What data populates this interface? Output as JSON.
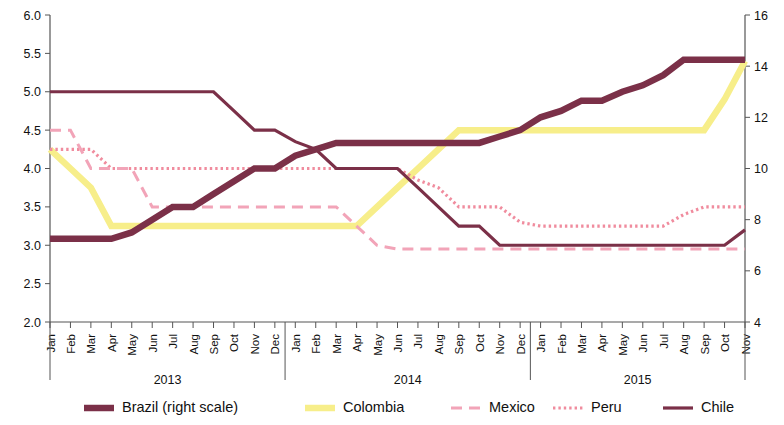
{
  "chart_data": {
    "type": "line",
    "title": "",
    "subtitle": "",
    "xlabel": "",
    "ylabel": "",
    "y2label": "",
    "grid": false,
    "legend_position": "bottom",
    "ylim": [
      2.0,
      6.0
    ],
    "y_ticks": [
      "2.0",
      "2.5",
      "3.0",
      "3.5",
      "4.0",
      "4.5",
      "5.0",
      "5.5",
      "6.0"
    ],
    "y2lim": [
      4,
      16
    ],
    "y2_ticks": [
      "4",
      "6",
      "8",
      "10",
      "12",
      "14",
      "16"
    ],
    "x_group_labels": [
      "2013",
      "2014",
      "2015"
    ],
    "x_groups": [
      {
        "year": "2013",
        "months": [
          "Jan",
          "Feb",
          "Mar",
          "Apr",
          "May",
          "Jun",
          "Jul",
          "Aug",
          "Sep",
          "Oct",
          "Nov",
          "Dec"
        ]
      },
      {
        "year": "2014",
        "months": [
          "Jan",
          "Feb",
          "Mar",
          "Apr",
          "May",
          "Jun",
          "Jul",
          "Aug",
          "Sep",
          "Oct",
          "Nov",
          "Dec"
        ]
      },
      {
        "year": "2015",
        "months": [
          "Jan",
          "Feb",
          "Mar",
          "Apr",
          "May",
          "Jun",
          "Jul",
          "Aug",
          "Sep",
          "Oct",
          "Nov"
        ]
      }
    ],
    "x": [
      "2013-Jan",
      "2013-Feb",
      "2013-Mar",
      "2013-Apr",
      "2013-May",
      "2013-Jun",
      "2013-Jul",
      "2013-Aug",
      "2013-Sep",
      "2013-Oct",
      "2013-Nov",
      "2013-Dec",
      "2014-Jan",
      "2014-Feb",
      "2014-Mar",
      "2014-Apr",
      "2014-May",
      "2014-Jun",
      "2014-Jul",
      "2014-Aug",
      "2014-Sep",
      "2014-Oct",
      "2014-Nov",
      "2014-Dec",
      "2015-Jan",
      "2015-Feb",
      "2015-Mar",
      "2015-Apr",
      "2015-May",
      "2015-Jun",
      "2015-Jul",
      "2015-Aug",
      "2015-Sep",
      "2015-Oct",
      "2015-Nov"
    ],
    "series": [
      {
        "name": "Brazil (right scale)",
        "axis": "right",
        "color": "#7B3048",
        "style": "thick-solid",
        "values": [
          7.25,
          7.25,
          7.25,
          7.25,
          7.5,
          8.0,
          8.5,
          8.5,
          9.0,
          9.5,
          10.0,
          10.0,
          10.5,
          10.75,
          11.0,
          11.0,
          11.0,
          11.0,
          11.0,
          11.0,
          11.0,
          11.0,
          11.25,
          11.5,
          12.0,
          12.25,
          12.65,
          12.65,
          13.0,
          13.25,
          13.65,
          14.25,
          14.25,
          14.25,
          14.25
        ]
      },
      {
        "name": "Colombia",
        "axis": "left",
        "color": "#F7EE8A",
        "style": "thick-solid",
        "values": [
          4.25,
          4.0,
          3.75,
          3.25,
          3.25,
          3.25,
          3.25,
          3.25,
          3.25,
          3.25,
          3.25,
          3.25,
          3.25,
          3.25,
          3.25,
          3.25,
          3.5,
          3.75,
          4.0,
          4.25,
          4.5,
          4.5,
          4.5,
          4.5,
          4.5,
          4.5,
          4.5,
          4.5,
          4.5,
          4.5,
          4.5,
          4.5,
          4.5,
          4.9,
          5.4
        ]
      },
      {
        "name": "Mexico",
        "axis": "left",
        "color": "#F2A4B8",
        "style": "dashed",
        "values": [
          4.5,
          4.5,
          4.0,
          4.0,
          4.0,
          3.5,
          3.5,
          3.5,
          3.5,
          3.5,
          3.5,
          3.5,
          3.5,
          3.5,
          3.5,
          3.25,
          3.0,
          2.95,
          2.95,
          2.95,
          2.95,
          2.95,
          2.95,
          2.95,
          2.95,
          2.95,
          2.95,
          2.95,
          2.95,
          2.95,
          2.95,
          2.95,
          2.95,
          2.95,
          2.95
        ]
      },
      {
        "name": "Peru",
        "axis": "left",
        "color": "#F08C9E",
        "style": "dotted",
        "values": [
          4.25,
          4.25,
          4.25,
          4.0,
          4.0,
          4.0,
          4.0,
          4.0,
          4.0,
          4.0,
          4.0,
          4.0,
          4.0,
          4.0,
          4.0,
          4.0,
          4.0,
          4.0,
          3.85,
          3.75,
          3.5,
          3.5,
          3.5,
          3.3,
          3.25,
          3.25,
          3.25,
          3.25,
          3.25,
          3.25,
          3.25,
          3.4,
          3.5,
          3.5,
          3.5
        ]
      },
      {
        "name": "Chile",
        "axis": "left",
        "color": "#7B3048",
        "style": "thin-solid",
        "values": [
          5.0,
          5.0,
          5.0,
          5.0,
          5.0,
          5.0,
          5.0,
          5.0,
          5.0,
          4.75,
          4.5,
          4.5,
          4.35,
          4.25,
          4.0,
          4.0,
          4.0,
          4.0,
          3.75,
          3.5,
          3.25,
          3.25,
          3.0,
          3.0,
          3.0,
          3.0,
          3.0,
          3.0,
          3.0,
          3.0,
          3.0,
          3.0,
          3.0,
          3.0,
          3.2
        ]
      }
    ],
    "legend": [
      {
        "label": "Brazil (right scale)",
        "color": "#7B3048",
        "style": "thick-solid"
      },
      {
        "label": "Colombia",
        "color": "#F7EE8A",
        "style": "thick-solid"
      },
      {
        "label": "Mexico",
        "color": "#F2A4B8",
        "style": "dashed"
      },
      {
        "label": "Peru",
        "color": "#F08C9E",
        "style": "dotted"
      },
      {
        "label": "Chile",
        "color": "#7B3048",
        "style": "thin-solid"
      }
    ]
  }
}
